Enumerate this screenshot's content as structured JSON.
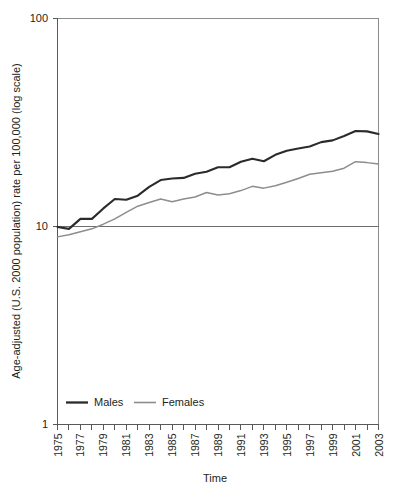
{
  "chart_data": {
    "type": "line",
    "title": "",
    "xlabel": "Time",
    "ylabel": "Age-adjusted (U.S. 2000 population) rate per 100,000 (log scale)",
    "yscale": "log",
    "ylim": [
      1,
      100
    ],
    "y_tick_labels": [
      "100",
      "10",
      "1"
    ],
    "y_tick_values": [
      100,
      10,
      1
    ],
    "grid": "horizontal-at-10",
    "legend_position": "bottom-left",
    "x": [
      1975,
      1976,
      1977,
      1978,
      1979,
      1980,
      1981,
      1982,
      1983,
      1984,
      1985,
      1986,
      1987,
      1988,
      1989,
      1990,
      1991,
      1992,
      1993,
      1994,
      1995,
      1996,
      1997,
      1998,
      1999,
      2000,
      2001,
      2002,
      2003
    ],
    "x_tick_labels": [
      "1975",
      "1976",
      "1977",
      "1978",
      "1979",
      "1980",
      "1981",
      "1982",
      "1983",
      "1984",
      "1985",
      "1986",
      "1987",
      "1988",
      "1989",
      "1990",
      "1991",
      "1992",
      "1993",
      "1994",
      "1995",
      "1996",
      "1997",
      "1998",
      "1999",
      "2000",
      "2001",
      "2002",
      "2003"
    ],
    "x_tick_labels_shown": [
      "1975",
      "1977",
      "1979",
      "1981",
      "1983",
      "1985",
      "1987",
      "1989",
      "1991",
      "1993",
      "1995",
      "1997",
      "1999",
      "2001",
      "2003"
    ],
    "series": [
      {
        "name": "Males",
        "color": "#2b2b2b",
        "values": [
          9.4,
          9.2,
          10.3,
          10.3,
          11.6,
          12.9,
          12.8,
          13.4,
          14.8,
          16.0,
          16.3,
          16.4,
          17.2,
          17.6,
          18.5,
          18.5,
          19.7,
          20.4,
          19.8,
          21.3,
          22.3,
          22.9,
          23.4,
          24.6,
          25.1,
          26.4,
          27.9,
          27.8,
          27.0
        ]
      },
      {
        "name": "Females",
        "color": "#8c8d8f",
        "values": [
          8.4,
          8.6,
          8.9,
          9.2,
          9.7,
          10.3,
          11.1,
          11.9,
          12.4,
          12.9,
          12.5,
          12.9,
          13.2,
          13.9,
          13.5,
          13.7,
          14.2,
          14.9,
          14.6,
          15.0,
          15.6,
          16.3,
          17.1,
          17.4,
          17.7,
          18.3,
          19.7,
          19.5,
          19.2
        ]
      }
    ]
  },
  "legend": {
    "items": [
      {
        "label": "Males"
      },
      {
        "label": "Females"
      }
    ]
  },
  "axes": {
    "x_title": "Time",
    "y_title": "Age-adjusted (U.S. 2000 population) rate per 100,000 (log scale)",
    "y_top_label": "100",
    "y_mid_label": "10",
    "y_bottom_label": "1"
  }
}
